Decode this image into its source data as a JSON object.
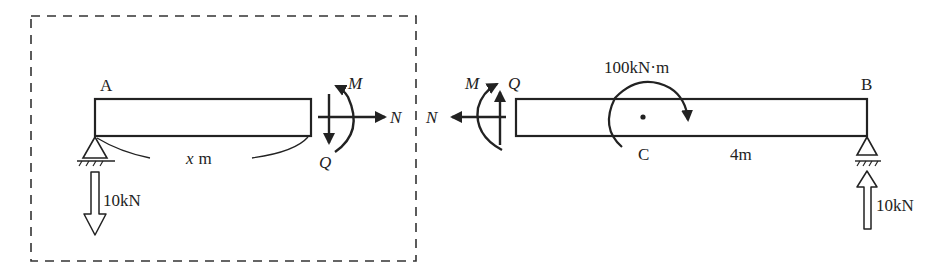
{
  "diagram": {
    "type": "free-body-diagram",
    "left_segment": {
      "end_label": "A",
      "support": "pin",
      "reaction": {
        "value": "10kN",
        "direction": "down"
      },
      "length_label": "x m",
      "internal_forces": {
        "moment": "M",
        "shear": "Q",
        "axial": "N"
      },
      "enclosed_in_dashed_box": true
    },
    "right_segment": {
      "end_label": "B",
      "support": "pin",
      "reaction": {
        "value": "10kN",
        "direction": "up"
      },
      "point_label": "C",
      "applied_moment": "100kN·m",
      "length_label": "4m",
      "internal_forces": {
        "moment": "M",
        "shear": "Q",
        "axial": "N"
      }
    }
  },
  "labels": {
    "A": "A",
    "B": "B",
    "C": "C",
    "x_length_var": "x",
    "x_length_unit": "m",
    "cb_length": "4m",
    "applied_moment": "100kN·m",
    "reaction_a": "10kN",
    "reaction_b": "10kN",
    "left_M": "M",
    "left_Q": "Q",
    "left_N": "N",
    "right_M": "M",
    "right_Q": "Q",
    "right_N": "N"
  },
  "colors": {
    "ink": "#222222",
    "background": "#ffffff"
  }
}
